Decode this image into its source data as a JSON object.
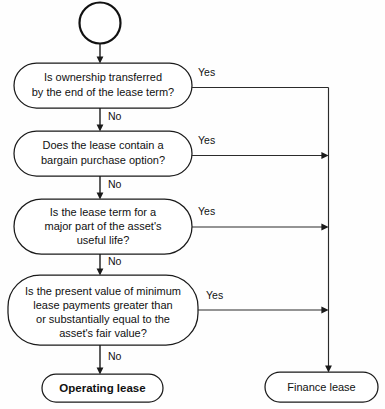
{
  "diagram": {
    "background_color": "#fefefe",
    "line_color": "#2b2b2b",
    "shape_fill": "#ffffff",
    "shape_stroke": "#1a1a1a"
  },
  "start_node": {
    "name": "start-circle",
    "label": ""
  },
  "decisions": [
    {
      "id": "ownership",
      "lines": [
        "Is ownership transferred",
        "by the end of the lease term?"
      ],
      "yes_label": "Yes",
      "no_label": "No"
    },
    {
      "id": "bargain-purchase",
      "lines": [
        "Does the lease contain a",
        "bargain purchase option?"
      ],
      "yes_label": "Yes",
      "no_label": "No"
    },
    {
      "id": "lease-term",
      "lines": [
        "Is the lease term for a",
        "major part of the asset's",
        "useful life?"
      ],
      "yes_label": "Yes",
      "no_label": "No"
    },
    {
      "id": "present-value",
      "lines": [
        "Is the present value of minimum",
        "lease payments greater than",
        "or substantially equal to the",
        "asset's fair value?"
      ],
      "yes_label": "Yes",
      "no_label": "No"
    }
  ],
  "outcomes": [
    {
      "id": "operating-lease",
      "label": "Operating lease"
    },
    {
      "id": "finance-lease",
      "label": "Finance lease"
    }
  ]
}
